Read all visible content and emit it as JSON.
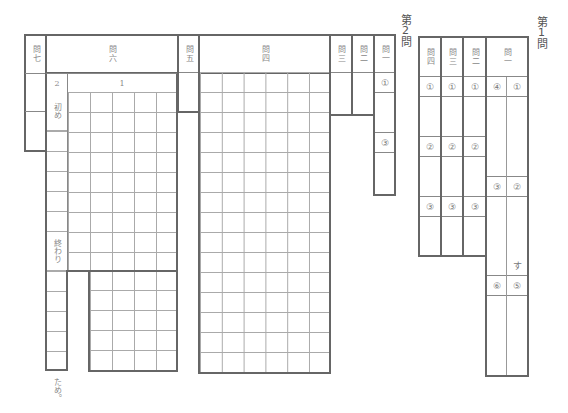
{
  "section2": {
    "label": "第2問",
    "q7": {
      "header": "問七"
    },
    "q6": {
      "header": "問六",
      "part2": "2",
      "part1": "1",
      "start": "初め",
      "end": "終わり",
      "suffix": "ため。",
      "grid_cols": 5
    },
    "q5": {
      "header": "問五"
    },
    "q4": {
      "header": "問四",
      "grid_cols": 6,
      "grid_rows": 15
    },
    "q3": {
      "header": "問三"
    },
    "q2": {
      "header": "問二"
    },
    "q1": {
      "header": "問一",
      "items": [
        "①",
        "③"
      ]
    }
  },
  "section1": {
    "label": "第1問",
    "q4": {
      "header": "問四",
      "items": [
        "①",
        "②",
        "③"
      ]
    },
    "q3": {
      "header": "問三",
      "items": [
        "①",
        "②",
        "③"
      ]
    },
    "q2": {
      "header": "問二",
      "items": [
        "①",
        "②",
        "③"
      ]
    },
    "q1": {
      "header": "問一",
      "items_left": [
        "④",
        "③",
        "⑥"
      ],
      "items_right": [
        "①",
        "②",
        "⑤"
      ],
      "suffix": "す"
    }
  }
}
